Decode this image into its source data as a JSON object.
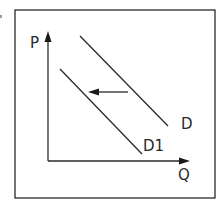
{
  "diagram": {
    "axes": {
      "y_label": "P",
      "x_label": "Q"
    },
    "curves": [
      {
        "id": "D",
        "label": "D",
        "x1": 80,
        "y1": 36,
        "x2": 168,
        "y2": 126
      },
      {
        "id": "D1",
        "label": "D1",
        "x1": 60,
        "y1": 69,
        "x2": 142,
        "y2": 154
      }
    ],
    "shift_arrow": {
      "from_x": 128,
      "to_x": 89,
      "y": 92,
      "direction": "left"
    },
    "colors": {
      "line": "#2a2a2a",
      "frame": "#2a2a2a",
      "background": "#ffffff",
      "corner_mark": "#9a9a9a"
    }
  }
}
